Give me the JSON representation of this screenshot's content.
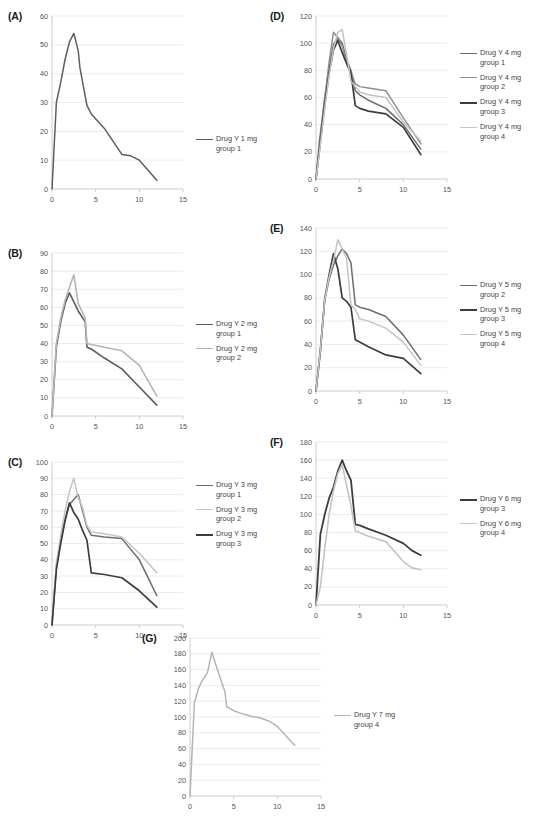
{
  "figure": {
    "caption": "",
    "panels": [
      {
        "id": "A",
        "label": "(A)",
        "chart_data": {
          "type": "line",
          "title": "",
          "xlabel": "",
          "ylabel": "",
          "xlim": [
            0,
            15
          ],
          "ylim": [
            0,
            60
          ],
          "xticks": [
            0,
            5,
            10,
            15
          ],
          "yticks": [
            0,
            10,
            20,
            30,
            40,
            50,
            60
          ],
          "grid": true,
          "legend_position": "right",
          "x": [
            0,
            0.5,
            1,
            1.5,
            2,
            2.5,
            3,
            3.2,
            4,
            4.5,
            6,
            8,
            9,
            10,
            12
          ],
          "series": [
            {
              "name": "Drug Y 1 mg group 1",
              "color": "#5e5e5e",
              "width": 1.5,
              "values": [
                0,
                30,
                37,
                45,
                51,
                54,
                48,
                42,
                29,
                26,
                21,
                12,
                11.5,
                10,
                3
              ]
            }
          ]
        },
        "legend": [
          {
            "line1": "Drug Y 1 mg",
            "line2": "group 1",
            "color": "#5e5e5e",
            "width": 1.8
          }
        ]
      },
      {
        "id": "B",
        "label": "(B)",
        "chart_data": {
          "type": "line",
          "title": "",
          "xlabel": "",
          "ylabel": "",
          "xlim": [
            0,
            15
          ],
          "ylim": [
            0,
            90
          ],
          "xticks": [
            0,
            5,
            10,
            15
          ],
          "yticks": [
            0,
            10,
            20,
            30,
            40,
            50,
            60,
            70,
            80,
            90
          ],
          "grid": true,
          "legend_position": "right",
          "x": [
            0,
            0.5,
            1,
            1.5,
            2,
            2.5,
            3,
            3.8,
            4,
            4.5,
            6,
            8,
            10,
            12
          ],
          "series": [
            {
              "name": "Drug Y 2 mg group 1",
              "color": "#5e5e5e",
              "width": 1.6,
              "values": [
                0,
                38,
                52,
                62,
                68,
                63,
                58,
                52,
                38,
                37,
                32,
                26,
                16,
                6
              ]
            },
            {
              "name": "Drug Y 2 mg group 2",
              "color": "#b5b5b5",
              "width": 1.6,
              "values": [
                0,
                40,
                54,
                64,
                71,
                78,
                62,
                54,
                40,
                39.5,
                38,
                36,
                28,
                11
              ]
            }
          ]
        },
        "legend": [
          {
            "line1": "Drug Y 2 mg",
            "line2": "group 1",
            "color": "#5e5e5e",
            "width": 1.8
          },
          {
            "line1": "Drug Y 2 mg",
            "line2": "group 2",
            "color": "#b5b5b5",
            "width": 1.8
          }
        ]
      },
      {
        "id": "C",
        "label": "(C)",
        "chart_data": {
          "type": "line",
          "title": "",
          "xlabel": "",
          "ylabel": "",
          "xlim": [
            0,
            15
          ],
          "ylim": [
            0,
            100
          ],
          "xticks": [
            0,
            5,
            10,
            15
          ],
          "yticks": [
            0,
            10,
            20,
            30,
            40,
            50,
            60,
            70,
            80,
            90,
            100
          ],
          "grid": true,
          "legend_position": "right",
          "x": [
            0,
            0.5,
            1,
            1.5,
            2,
            2.5,
            3,
            3.5,
            4,
            4.5,
            6,
            8,
            10,
            12
          ],
          "series": [
            {
              "name": "Drug Y 3 mg group 1",
              "color": "#6e6e6e",
              "width": 1.5,
              "values": [
                0,
                36,
                52,
                65,
                74,
                77,
                80,
                70,
                60,
                55,
                54,
                53,
                40,
                18
              ]
            },
            {
              "name": "Drug Y 3 mg group 2",
              "color": "#c4c4c4",
              "width": 1.5,
              "values": [
                0,
                38,
                55,
                70,
                82,
                90,
                78,
                72,
                61,
                57,
                56,
                54,
                44,
                32
              ]
            },
            {
              "name": "Drug Y 3 mg group 3",
              "color": "#3d3d3d",
              "width": 1.7,
              "values": [
                0,
                34,
                50,
                64,
                75,
                69,
                65,
                58,
                52,
                32,
                31,
                29,
                21,
                11
              ]
            }
          ]
        },
        "legend": [
          {
            "line1": "Drug Y 3 mg",
            "line2": "group 1",
            "color": "#6e6e6e",
            "width": 1.8
          },
          {
            "line1": "Drug Y 3 mg",
            "line2": "group 2",
            "color": "#c4c4c4",
            "width": 1.8
          },
          {
            "line1": "Drug Y 3 mg",
            "line2": "group 3",
            "color": "#3d3d3d",
            "width": 2.1
          }
        ]
      },
      {
        "id": "D",
        "label": "(D)",
        "chart_data": {
          "type": "line",
          "title": "",
          "xlabel": "",
          "ylabel": "",
          "xlim": [
            0,
            15
          ],
          "ylim": [
            0,
            120
          ],
          "xticks": [
            0,
            5,
            10,
            15
          ],
          "yticks": [
            0,
            20,
            40,
            60,
            80,
            100,
            120
          ],
          "grid": true,
          "legend_position": "right",
          "x": [
            0,
            0.4,
            1,
            1.5,
            2,
            2.5,
            3,
            3.5,
            4,
            4.5,
            5,
            6,
            8,
            10,
            12
          ],
          "series": [
            {
              "name": "Drug Y 4 mg group 1",
              "color": "#6e6e6e",
              "width": 1.5,
              "values": [
                0,
                28,
                60,
                82,
                99,
                104,
                100,
                88,
                80,
                65,
                62,
                58,
                52,
                40,
                22
              ]
            },
            {
              "name": "Drug Y 4 mg group 2",
              "color": "#8f8f8f",
              "width": 1.5,
              "values": [
                0,
                24,
                58,
                86,
                108,
                104,
                98,
                86,
                79,
                70,
                68,
                67,
                65,
                45,
                26
              ]
            },
            {
              "name": "Drug Y 4 mg group 3",
              "color": "#3d3d3d",
              "width": 1.7,
              "values": [
                0,
                22,
                55,
                78,
                95,
                102,
                93,
                85,
                78,
                54,
                52,
                50,
                48,
                38,
                18
              ]
            },
            {
              "name": "Drug Y 4 mg group 4",
              "color": "#c4c4c4",
              "width": 1.5,
              "values": [
                0,
                20,
                52,
                76,
                96,
                108,
                110,
                92,
                72,
                68,
                64,
                62,
                60,
                42,
                28
              ]
            }
          ]
        },
        "legend": [
          {
            "line1": "Drug Y 4 mg",
            "line2": "group 1",
            "color": "#6e6e6e",
            "width": 1.8
          },
          {
            "line1": "Drug Y 4 mg",
            "line2": "group 2",
            "color": "#8f8f8f",
            "width": 1.8
          },
          {
            "line1": "Drug Y 4 mg",
            "line2": "group 3",
            "color": "#3d3d3d",
            "width": 2.1
          },
          {
            "line1": "Drug Y  4 mg",
            "line2": "group 4",
            "color": "#c4c4c4",
            "width": 1.8
          }
        ]
      },
      {
        "id": "E",
        "label": "(E)",
        "chart_data": {
          "type": "line",
          "title": "",
          "xlabel": "",
          "ylabel": "",
          "xlim": [
            0,
            15
          ],
          "ylim": [
            0,
            140
          ],
          "xticks": [
            0,
            5,
            10,
            15
          ],
          "yticks": [
            0,
            20,
            40,
            60,
            80,
            100,
            120,
            140
          ],
          "grid": true,
          "legend_position": "right",
          "x": [
            0,
            0.5,
            1,
            1.5,
            2,
            2.5,
            3,
            3.5,
            4,
            4.5,
            5,
            6,
            8,
            10,
            12
          ],
          "series": [
            {
              "name": "Drug Y 5 mg group 2",
              "color": "#6e6e6e",
              "width": 1.5,
              "values": [
                0,
                36,
                78,
                96,
                108,
                116,
                122,
                118,
                110,
                74,
                72,
                70,
                64,
                48,
                27
              ]
            },
            {
              "name": "Drug Y 5 mg group 3",
              "color": "#3d3d3d",
              "width": 1.7,
              "values": [
                0,
                34,
                79,
                100,
                118,
                105,
                80,
                77,
                72,
                44,
                42,
                38,
                31,
                28,
                15
              ]
            },
            {
              "name": "Drug Y 5 mg group 4",
              "color": "#c4c4c4",
              "width": 1.5,
              "values": [
                0,
                35,
                78,
                98,
                112,
                130,
                122,
                114,
                74,
                70,
                62,
                60,
                54,
                42,
                22
              ]
            }
          ]
        },
        "legend": [
          {
            "line1": "Drug Y 5 mg",
            "line2": "group 2",
            "color": "#6e6e6e",
            "width": 1.8
          },
          {
            "line1": "Drug Y 5 mg",
            "line2": "group 3",
            "color": "#3d3d3d",
            "width": 2.1
          },
          {
            "line1": "Drug Y 5 mg",
            "line2": "group 4",
            "color": "#c4c4c4",
            "width": 1.8
          }
        ]
      },
      {
        "id": "F",
        "label": "(F)",
        "chart_data": {
          "type": "line",
          "title": "",
          "xlabel": "",
          "ylabel": "",
          "xlim": [
            0,
            15
          ],
          "ylim": [
            0,
            180
          ],
          "xticks": [
            0,
            5,
            10,
            15
          ],
          "yticks": [
            0,
            20,
            40,
            60,
            80,
            100,
            120,
            140,
            160,
            180
          ],
          "grid": true,
          "legend_position": "right",
          "x": [
            0,
            0.5,
            1,
            1.5,
            2,
            2.5,
            3,
            3.5,
            4,
            4.5,
            5,
            6,
            8,
            10,
            11,
            12
          ],
          "series": [
            {
              "name": "Drug Y 6 mg group 3",
              "color": "#3d3d3d",
              "width": 1.8,
              "values": [
                0,
                78,
                100,
                118,
                130,
                148,
                160,
                148,
                138,
                89,
                88,
                84,
                77,
                68,
                60,
                55
              ]
            },
            {
              "name": "Drug Y 6 mg group 4",
              "color": "#c4c4c4",
              "width": 1.6,
              "values": [
                0,
                20,
                62,
                100,
                126,
                145,
                155,
                132,
                110,
                82,
                80,
                76,
                70,
                48,
                41,
                39
              ]
            }
          ]
        },
        "legend": [
          {
            "line1": "Drug Y 6 mg",
            "line2": "group 3",
            "color": "#3d3d3d",
            "width": 2.1
          },
          {
            "line1": "Drug Y 6 mg",
            "line2": "group 4",
            "color": "#c4c4c4",
            "width": 1.8
          }
        ]
      },
      {
        "id": "G",
        "label": "(G)",
        "chart_data": {
          "type": "line",
          "title": "",
          "xlabel": "",
          "ylabel": "",
          "xlim": [
            0,
            15
          ],
          "ylim": [
            0,
            200
          ],
          "xticks": [
            0,
            5,
            10,
            15
          ],
          "yticks": [
            0,
            20,
            40,
            60,
            80,
            100,
            120,
            140,
            160,
            180,
            200
          ],
          "grid": true,
          "legend_position": "right",
          "x": [
            0,
            0.5,
            1,
            1.5,
            2,
            2.5,
            3,
            3.5,
            4,
            4.2,
            5,
            6,
            7,
            8,
            9,
            10,
            11,
            12
          ],
          "series": [
            {
              "name": "Drug Y 7 mg group 4",
              "color": "#b5b5b5",
              "width": 1.5,
              "values": [
                0,
                118,
                137,
                148,
                156,
                182,
                165,
                148,
                132,
                113,
                108,
                104,
                101,
                99,
                95,
                88,
                76,
                64
              ]
            }
          ]
        },
        "legend": [
          {
            "line1": "Drug Y 7 mg",
            "line2": "group 4",
            "color": "#b5b5b5",
            "width": 1.8
          }
        ]
      }
    ]
  }
}
